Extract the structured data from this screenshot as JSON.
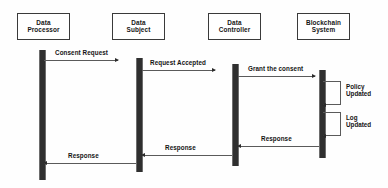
{
  "diagram": {
    "kind": "uml-sequence-diagram",
    "background_color": "#ffffff",
    "line_color": "#5a5a5a",
    "lifeline_color": "#2f2f2f",
    "text_color": "#141414"
  },
  "actors": [
    {
      "id": "data-processor",
      "line1": "Data",
      "line2": "Processor",
      "x": 17,
      "y": 13,
      "w": 53,
      "h": 27,
      "bar_x": 39,
      "bar_y": 50,
      "bar_w": 5,
      "bar_h": 130
    },
    {
      "id": "data-subject",
      "line1": "Data",
      "line2": "Subject",
      "x": 112,
      "y": 13,
      "w": 53,
      "h": 27,
      "bar_x": 136,
      "bar_y": 58,
      "bar_w": 5,
      "bar_h": 114
    },
    {
      "id": "data-controller",
      "line1": "Data",
      "line2": "Controller",
      "x": 208,
      "y": 13,
      "w": 53,
      "h": 27,
      "bar_x": 232,
      "bar_y": 64,
      "bar_w": 5,
      "bar_h": 102
    },
    {
      "id": "blockchain-system",
      "line1": "Blockchain",
      "line2": "System",
      "x": 297,
      "y": 13,
      "w": 53,
      "h": 27,
      "bar_x": 319,
      "bar_y": 70,
      "bar_w": 5,
      "bar_h": 88
    }
  ],
  "messages": [
    {
      "id": "consent-request",
      "label": "Consent Request",
      "direction": "right",
      "from": "data-processor",
      "to": "data-subject",
      "x": 44,
      "y": 60,
      "w": 74,
      "label_x": 55,
      "label_y": 50
    },
    {
      "id": "request-accepted",
      "label": "Request Accepted",
      "direction": "right",
      "from": "data-subject",
      "to": "data-controller",
      "x": 142,
      "y": 70,
      "w": 73,
      "label_x": 150,
      "label_y": 60
    },
    {
      "id": "grant-the-consent",
      "label": "Grant the consent",
      "direction": "right",
      "from": "data-controller",
      "to": "blockchain-system",
      "x": 238,
      "y": 76,
      "w": 77,
      "label_x": 248,
      "label_y": 66
    },
    {
      "id": "response-blockchain",
      "label": "Response",
      "direction": "left",
      "from": "blockchain-system",
      "to": "data-controller",
      "x": 238,
      "y": 146,
      "w": 81,
      "label_x": 261,
      "label_y": 136
    },
    {
      "id": "response-controller",
      "label": "Response",
      "direction": "left",
      "from": "data-controller",
      "to": "data-subject",
      "x": 142,
      "y": 155,
      "w": 90,
      "label_x": 165,
      "label_y": 145
    },
    {
      "id": "response-subject",
      "label": "Response",
      "direction": "left",
      "from": "data-subject",
      "to": "data-processor",
      "x": 44,
      "y": 163,
      "w": 92,
      "label_x": 68,
      "label_y": 153
    }
  ],
  "self_messages": [
    {
      "id": "policy-updated",
      "line1": "Policy",
      "line2": "Updated",
      "actor": "blockchain-system",
      "x": 323,
      "y": 81,
      "w": 18,
      "h": 24,
      "label_x": 346,
      "label_y": 84
    },
    {
      "id": "log-updated",
      "line1": "Log",
      "line2": "Updated",
      "actor": "blockchain-system",
      "x": 323,
      "y": 112,
      "w": 18,
      "h": 24,
      "label_x": 346,
      "label_y": 115
    }
  ]
}
